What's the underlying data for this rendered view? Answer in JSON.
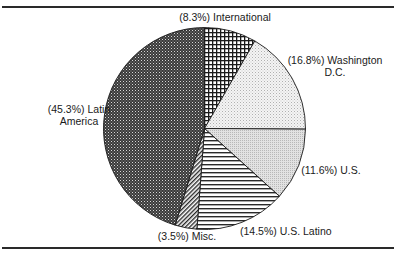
{
  "chart_data": {
    "type": "pie",
    "title": "",
    "start_angle": "12 o'clock",
    "direction": "clockwise",
    "categories": [
      "International",
      "Washington D.C.",
      "U.S.",
      "U.S. Latino",
      "Misc.",
      "Latin America"
    ],
    "values": [
      8.3,
      16.8,
      11.6,
      14.5,
      3.5,
      45.3
    ],
    "unit": "%",
    "slices": [
      {
        "name": "International",
        "value": 8.3,
        "label": "(8.3%) International",
        "pattern": "crosshatch-grid"
      },
      {
        "name": "Washington D.C.",
        "value": 16.8,
        "label_line1": "(16.8%) Washington",
        "label_line2": "D.C.",
        "pattern": "light-dots"
      },
      {
        "name": "U.S.",
        "value": 11.6,
        "label": "(11.6%) U.S.",
        "pattern": "light-grey-dots"
      },
      {
        "name": "U.S. Latino",
        "value": 14.5,
        "label": "(14.5%) U.S. Latino",
        "pattern": "horizontal-lines"
      },
      {
        "name": "Misc.",
        "value": 3.5,
        "label": "(3.5%) Misc.",
        "pattern": "diagonal-lines"
      },
      {
        "name": "Latin America",
        "value": 45.3,
        "label_line1": "(45.3%) Latin",
        "label_line2": "America",
        "pattern": "dark-checker"
      }
    ],
    "legend": "none (inline labels)",
    "grid": false
  }
}
